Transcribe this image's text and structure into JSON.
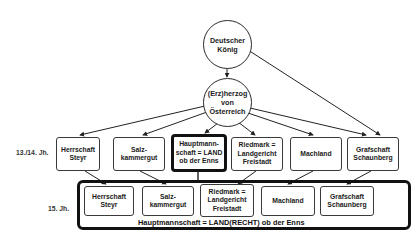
{
  "nodes": {
    "king": "Deutscher\nKönig",
    "duke": "(Erz)herzog\nvon\nÖsterreich"
  },
  "row_labels": {
    "row1": "13./14. Jh.",
    "row2": "15. Jh."
  },
  "row1_boxes": [
    {
      "label": "Herrschaft\nSteyr"
    },
    {
      "label": "Salz-\nkammergut"
    },
    {
      "label": "Hauptmann-\nschaft = LAND\nob der Enns",
      "emphasized": true
    },
    {
      "label": "Riedmark =\nLandgericht\nFreistadt"
    },
    {
      "label": "Machland"
    },
    {
      "label": "Grafschaft\nSchaunberg"
    }
  ],
  "row2_boxes": [
    {
      "label": "Herrschaft\nSteyr"
    },
    {
      "label": "Salz-\nkammergut"
    },
    {
      "label": "Riedmark =\nLandgericht\nFreistadt"
    },
    {
      "label": "Machland"
    },
    {
      "label": "Grafschaft\nSchaunberg"
    }
  ],
  "frame_label": "Hauptmannschaft = LAND(RECHT) ob der Enns"
}
